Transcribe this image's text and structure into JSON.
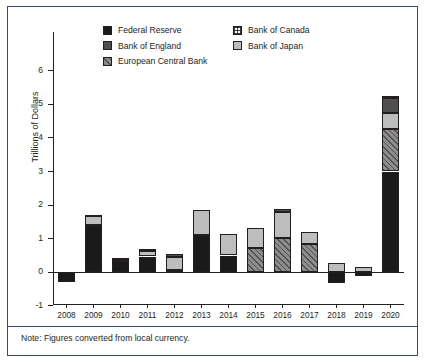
{
  "note": "Note: Figures converted from local currency.",
  "legend": {
    "rows": [
      [
        {
          "label": "Federal Reserve",
          "key": "fed",
          "swatch": "solid-black-swatch"
        },
        {
          "label": "Bank of Canada",
          "key": "boc",
          "swatch": "white-grid-pattern-swatch"
        }
      ],
      [
        {
          "label": "Bank of England",
          "key": "boe",
          "swatch": "dark-gray-swatch"
        },
        {
          "label": "Bank of Japan",
          "key": "boj",
          "swatch": "light-gray-swatch"
        }
      ],
      [
        {
          "label": "European Central Bank",
          "key": "ecb",
          "swatch": "hatched-gray-swatch"
        }
      ]
    ]
  },
  "chart_data": {
    "type": "bar",
    "stacked": true,
    "title": "",
    "xlabel": "",
    "ylabel": "Trillions of Dollars",
    "ylim": [
      -1,
      6
    ],
    "yticks": [
      -1,
      0,
      1,
      2,
      3,
      4,
      5,
      6
    ],
    "ytick_labels": [
      "-1",
      "0",
      "1",
      "2",
      "3",
      "4",
      "5",
      "6"
    ],
    "grid": false,
    "legend_position": "top-center",
    "categories": [
      "2008",
      "2009",
      "2010",
      "2011",
      "2012",
      "2013",
      "2014",
      "2015",
      "2016",
      "2017",
      "2018",
      "2019",
      "2020"
    ],
    "series": [
      {
        "name": "Federal Reserve",
        "key": "fed",
        "color": "#1a1a1a",
        "values": [
          -0.3,
          1.4,
          0.33,
          0.47,
          0.08,
          1.12,
          0.5,
          0.0,
          0.0,
          0.0,
          -0.33,
          -0.12,
          3.0
        ]
      },
      {
        "name": "European Central Bank",
        "key": "ecb",
        "color": "#8d8d8d",
        "values": [
          0.0,
          0.0,
          0.0,
          0.0,
          0.0,
          0.0,
          0.0,
          0.73,
          1.02,
          0.85,
          0.0,
          0.0,
          1.27
        ]
      },
      {
        "name": "Bank of Japan",
        "key": "boj",
        "color": "#bdbdbd",
        "values": [
          0.0,
          0.3,
          0.05,
          0.17,
          0.38,
          0.72,
          0.65,
          0.59,
          0.78,
          0.34,
          0.27,
          0.17,
          0.47
        ]
      },
      {
        "name": "Bank of England",
        "key": "boe",
        "color": "#4f4f4f",
        "values": [
          0.0,
          0.02,
          0.04,
          0.06,
          0.09,
          0.0,
          0.0,
          0.0,
          0.07,
          0.0,
          0.0,
          0.0,
          0.44
        ]
      },
      {
        "name": "Bank of Canada",
        "key": "boc",
        "color": "#ffffff",
        "values": [
          0.0,
          0.0,
          0.0,
          0.0,
          0.0,
          0.0,
          0.0,
          0.0,
          0.0,
          0.0,
          0.0,
          0.0,
          0.08
        ]
      }
    ],
    "totals_positive": [
      0.0,
      1.72,
      0.42,
      0.7,
      0.55,
      1.84,
      1.15,
      1.32,
      1.87,
      1.19,
      0.27,
      0.17,
      5.26
    ],
    "totals_negative": [
      -0.3,
      0.0,
      0.0,
      0.0,
      0.0,
      0.0,
      0.0,
      0.0,
      0.0,
      0.0,
      -0.33,
      -0.12,
      0.0
    ]
  }
}
